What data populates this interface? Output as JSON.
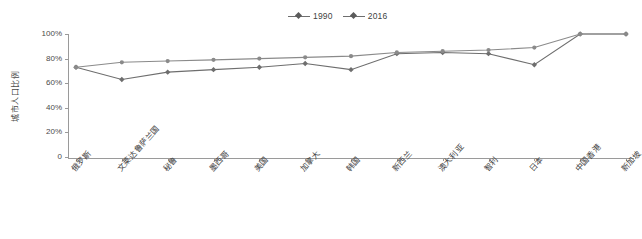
{
  "legend": {
    "position": "top-center",
    "entries": [
      {
        "label": "1990",
        "icon": "line-diamond-marker-icon",
        "color": "#6e6e6e"
      },
      {
        "label": "2016",
        "icon": "line-circle-marker-icon",
        "color": "#8a8a8a"
      }
    ]
  },
  "axes": {
    "y_title": "城市人口比例",
    "y_ticks": [
      "0",
      "20%",
      "40%",
      "60%",
      "80%",
      "100%"
    ],
    "x_labels": [
      "俄罗斯",
      "文莱达鲁萨兰国",
      "秘鲁",
      "墨西哥",
      "美国",
      "加拿大",
      "韩国",
      "新西兰",
      "澳大利亚",
      "智利",
      "日本",
      "中国香港",
      "新加坡"
    ]
  },
  "colors": {
    "series_1990": "#6e6e6e",
    "series_2016": "#8a8a8a",
    "axis": "#9a9a9a",
    "text": "#3f3f3f",
    "background": "#ffffff"
  },
  "chart_data": {
    "type": "line",
    "title": "",
    "subtitle": "",
    "xlabel": "",
    "ylabel": "城市人口比例",
    "ylim": [
      0,
      100
    ],
    "yticks": [
      0,
      20,
      40,
      60,
      80,
      100
    ],
    "ytick_labels": [
      "0",
      "20%",
      "40%",
      "60%",
      "80%",
      "100%"
    ],
    "grid": false,
    "legend_position": "top-center",
    "categories": [
      "俄罗斯",
      "文莱达鲁萨兰国",
      "秘鲁",
      "墨西哥",
      "美国",
      "加拿大",
      "韩国",
      "新西兰",
      "澳大利亚",
      "智利",
      "日本",
      "中国香港",
      "新加坡"
    ],
    "series": [
      {
        "name": "1990",
        "marker": "diamond",
        "values": [
          73,
          63,
          69,
          71,
          73,
          76,
          71,
          84,
          85,
          84,
          75,
          100,
          100
        ]
      },
      {
        "name": "2016",
        "marker": "circle",
        "values": [
          73,
          77,
          78,
          79,
          80,
          81,
          82,
          85,
          86,
          87,
          89,
          100,
          100
        ]
      }
    ]
  }
}
